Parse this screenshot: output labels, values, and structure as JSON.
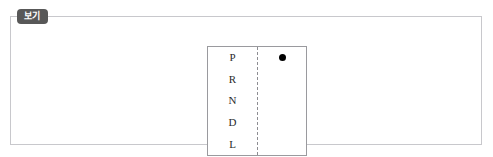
{
  "figure": {
    "tab_label": "보기",
    "panel_border_color": "#c8c8cc",
    "tab_background_color": "#585858",
    "tab_text_color": "#ffffff"
  },
  "gear_indicator": {
    "name": "automatic-transmission-gear-selector",
    "border_color": "#9a9a9e",
    "divider_style": "dashed",
    "divider_color": "#8d8d92",
    "marker_color": "#000000",
    "selected_gear": "P",
    "gears": [
      {
        "label": "P",
        "selected": true
      },
      {
        "label": "R",
        "selected": false
      },
      {
        "label": "N",
        "selected": false
      },
      {
        "label": "D",
        "selected": false
      },
      {
        "label": "L",
        "selected": false
      }
    ]
  }
}
